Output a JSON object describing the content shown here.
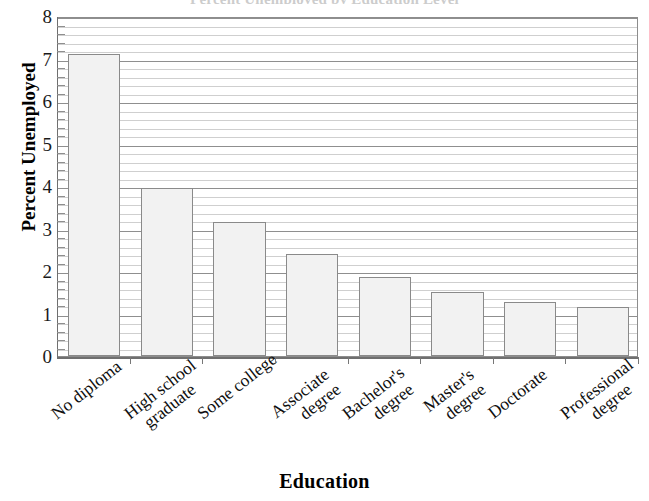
{
  "chart_data": {
    "type": "bar",
    "title": "",
    "xlabel": "Education",
    "ylabel": "Percent Unemployed",
    "categories": [
      "No diploma",
      "High school graduate",
      "Some college",
      "Associate degree",
      "Bachelor's degree",
      "Master's degree",
      "Doctorate",
      "Professional degree"
    ],
    "category_lines": [
      [
        "No diploma"
      ],
      [
        "High school",
        "graduate"
      ],
      [
        "Some college"
      ],
      [
        "Associate",
        "degree"
      ],
      [
        "Bachelor's",
        "degree"
      ],
      [
        "Master's",
        "degree"
      ],
      [
        "Doctorate"
      ],
      [
        "Professional",
        "degree"
      ]
    ],
    "values": [
      7.1,
      3.95,
      3.15,
      2.4,
      1.85,
      1.5,
      1.27,
      1.15
    ],
    "ylim": [
      0,
      8
    ],
    "ytick_labels": [
      "0",
      "1",
      "2",
      "3",
      "4",
      "5",
      "6",
      "7",
      "8"
    ],
    "ytick_values": [
      0,
      1,
      2,
      3,
      4,
      5,
      6,
      7,
      8
    ],
    "y_minor_step": 0.2,
    "grid": "horizontal-major-and-minor",
    "legend": "none",
    "bar_fill_color": "#f2f2f2",
    "bar_border_color": "#8a8a8a",
    "gridline_major_color": "#8f8f8f",
    "gridline_minor_color": "#cfcfcf",
    "axis_color": "#6f6f6f"
  },
  "title_partial": "Percent Unemployed by Education Level"
}
